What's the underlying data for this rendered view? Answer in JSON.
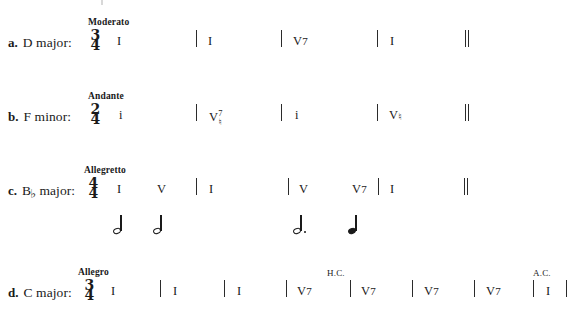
{
  "page": {
    "kind": "music-theory-worksheet",
    "ink_color": "#1a1a1a"
  },
  "exercises": [
    {
      "id": "a",
      "letter": "a.",
      "key": "D major:",
      "key_base": "D major:",
      "key_accidental": "",
      "tempo": "Moderato",
      "time_signature": {
        "numerator": "3",
        "denominator": "4"
      },
      "measures": [
        {
          "chord": "I",
          "suffix": "",
          "accidental": "",
          "cadence": ""
        },
        {
          "chord": "I",
          "suffix": "",
          "accidental": "",
          "cadence": ""
        },
        {
          "chord": "V",
          "suffix": "7",
          "accidental": "",
          "cadence": ""
        },
        {
          "chord": "I",
          "suffix": "",
          "accidental": "",
          "cadence": ""
        }
      ],
      "ending": "double-barline",
      "rhythm": []
    },
    {
      "id": "b",
      "letter": "b.",
      "key": "F minor:",
      "key_base": "F minor:",
      "key_accidental": "",
      "tempo": "Andante",
      "time_signature": {
        "numerator": "2",
        "denominator": "4"
      },
      "measures": [
        {
          "chord": "i",
          "suffix": "",
          "accidental": "",
          "cadence": ""
        },
        {
          "chord": "V",
          "suffix": "7",
          "accidental": "natural",
          "cadence": ""
        },
        {
          "chord": "i",
          "suffix": "",
          "accidental": "",
          "cadence": ""
        },
        {
          "chord": "V",
          "suffix": "",
          "accidental": "natural",
          "cadence": ""
        }
      ],
      "ending": "double-barline",
      "rhythm": []
    },
    {
      "id": "c",
      "letter": "c.",
      "key": "B♭ major:",
      "key_base": "B",
      "key_accidental": "♭",
      "key_tail": " major:",
      "tempo": "Allegretto",
      "time_signature": {
        "numerator": "4",
        "denominator": "4"
      },
      "measures": [
        {
          "chord": "I",
          "suffix": "",
          "accidental": "",
          "cadence": ""
        },
        {
          "chord": "V",
          "suffix": "",
          "accidental": "",
          "cadence": ""
        },
        {
          "chord": "I",
          "suffix": "",
          "accidental": "",
          "cadence": ""
        },
        {
          "chord": "V",
          "suffix": "",
          "accidental": "",
          "cadence": ""
        },
        {
          "chord": "V",
          "suffix": "7",
          "accidental": "",
          "cadence": ""
        },
        {
          "chord": "I",
          "suffix": "",
          "accidental": "",
          "cadence": ""
        }
      ],
      "ending": "double-barline",
      "rhythm": [
        {
          "type": "half",
          "dotted": false
        },
        {
          "type": "half",
          "dotted": false
        },
        {
          "type": "half",
          "dotted": true
        },
        {
          "type": "quarter",
          "dotted": false
        }
      ]
    },
    {
      "id": "d",
      "letter": "d.",
      "key": "C major:",
      "key_base": "C major:",
      "key_accidental": "",
      "tempo": "Allegro",
      "time_signature": {
        "numerator": "3",
        "denominator": "4"
      },
      "measures": [
        {
          "chord": "I",
          "suffix": "",
          "accidental": "",
          "cadence": ""
        },
        {
          "chord": "I",
          "suffix": "",
          "accidental": "",
          "cadence": ""
        },
        {
          "chord": "I",
          "suffix": "",
          "accidental": "",
          "cadence": ""
        },
        {
          "chord": "V",
          "suffix": "7",
          "accidental": "",
          "cadence": "H.C."
        },
        {
          "chord": "V",
          "suffix": "7",
          "accidental": "",
          "cadence": ""
        },
        {
          "chord": "V",
          "suffix": "7",
          "accidental": "",
          "cadence": ""
        },
        {
          "chord": "V",
          "suffix": "7",
          "accidental": "",
          "cadence": ""
        },
        {
          "chord": "I",
          "suffix": "",
          "accidental": "",
          "cadence": "A.C."
        }
      ],
      "ending": "barline",
      "rhythm": []
    }
  ],
  "glyphs": {
    "natural": "♮",
    "flat": "♭",
    "sharp": "♯"
  }
}
